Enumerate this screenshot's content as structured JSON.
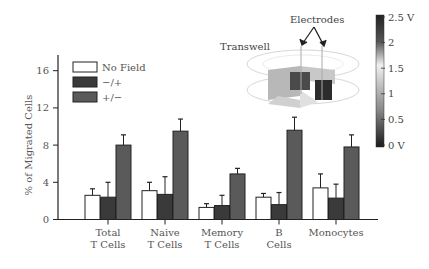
{
  "chart_data": {
    "type": "bar",
    "title": "",
    "xlabel": "",
    "ylabel": "% of Migrated Cells",
    "ylim": [
      0,
      18
    ],
    "yticks": [
      0,
      4,
      8,
      12,
      16
    ],
    "grid": false,
    "legend_position": "upper-left",
    "categories": [
      "Total T Cells",
      "Naive T Cells",
      "Memory T Cells",
      "B Cells",
      "Monocytes"
    ],
    "category_lines": [
      [
        "Total",
        "T Cells"
      ],
      [
        "Naive",
        "T Cells"
      ],
      [
        "Memory",
        "T Cells"
      ],
      [
        "B",
        "Cells"
      ],
      [
        "Monocytes"
      ]
    ],
    "series": [
      {
        "name": "No Field",
        "color": "#ffffff",
        "values": [
          2.6,
          3.1,
          1.3,
          2.4,
          3.4
        ],
        "error": [
          0.7,
          0.9,
          0.4,
          0.4,
          1.5
        ]
      },
      {
        "name": "−/+",
        "color": "#3a3a3a",
        "values": [
          2.4,
          2.7,
          1.5,
          1.6,
          2.3
        ],
        "error": [
          1.6,
          1.9,
          1.1,
          1.3,
          1.5
        ]
      },
      {
        "name": "+/−",
        "color": "#5a5a5a",
        "values": [
          8.0,
          9.5,
          4.9,
          9.6,
          7.8
        ],
        "error": [
          1.1,
          1.3,
          0.6,
          1.4,
          1.3
        ]
      }
    ],
    "inset": {
      "labels": {
        "transwell": "Transwell",
        "electrodes": "Electrodes"
      },
      "colorbar": {
        "ticks": [
          "2.5 V",
          "2",
          "1.5",
          "1",
          "0.5",
          "0 V"
        ],
        "min": 0,
        "max": 2.5
      }
    }
  }
}
